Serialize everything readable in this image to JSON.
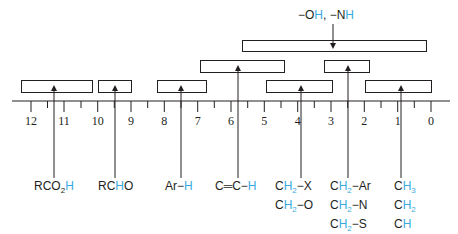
{
  "diagram": {
    "colors": {
      "ink": "#231f20",
      "hydrogen_highlight": "#3aa9e0"
    },
    "axis": {
      "ticks_major": [
        "12",
        "11",
        "10",
        "9",
        "8",
        "7",
        "6",
        "5",
        "4",
        "3",
        "2",
        "1",
        "0"
      ],
      "direction": "decreasing left to right (ppm)"
    },
    "labels": {
      "oh_nh": {
        "part1": "−O",
        "h1": "H",
        "sep": ", −N",
        "h2": "H"
      },
      "carboxylic_acid": {
        "pre": "RCO",
        "sub": "2",
        "h": "H"
      },
      "aldehyde": {
        "pre": "RC",
        "h": "H",
        "post": "O"
      },
      "aromatic": {
        "pre": "Ar−",
        "h": "H"
      },
      "vinyl": {
        "pre": "C═C−",
        "h": "H"
      },
      "alpha_heteroatom": [
        {
          "c": "C",
          "h": "H",
          "sub": "2",
          "post": "−X"
        },
        {
          "c": "C",
          "h": "H",
          "sub": "2",
          "post": "−O"
        }
      ],
      "allylic_benzylic": [
        {
          "c": "C",
          "h": "H",
          "sub": "2",
          "post": "−Ar"
        },
        {
          "c": "C",
          "h": "H",
          "sub": "2",
          "post": "−N"
        },
        {
          "c": "C",
          "h": "H",
          "sub": "2",
          "post": "−S"
        },
        {
          "c": "C",
          "h": "H",
          "sub": "2",
          "post": "C═O"
        },
        {
          "c": "C",
          "h": "H",
          "sub": "2",
          "post": "C═C"
        },
        {
          "c": "C≡C",
          "h": "H",
          "sub": "",
          "post": ""
        }
      ],
      "alkyl": [
        {
          "c": "C",
          "h": "H",
          "sub": "3"
        },
        {
          "c": "C",
          "h": "H",
          "sub": "2"
        },
        {
          "c": "C",
          "h": "H",
          "sub": ""
        }
      ]
    },
    "ranges": [
      {
        "name": "RCO2H",
        "from": 12.3,
        "to": 10.2
      },
      {
        "name": "RCHO",
        "from": 10.0,
        "to": 9.0
      },
      {
        "name": "Ar-H",
        "from": 8.2,
        "to": 6.7
      },
      {
        "name": "C=C-H",
        "from": 6.9,
        "to": 4.4
      },
      {
        "name": "CH2-X / CH2-O",
        "from": 5.0,
        "to": 3.0
      },
      {
        "name": "CH2-Ar ... C#CH",
        "from": 3.2,
        "to": 1.8
      },
      {
        "name": "CH3 / CH2 / CH",
        "from": 2.0,
        "to": 0.0
      },
      {
        "name": "OH, NH",
        "from": 5.7,
        "to": 0.2
      }
    ]
  }
}
